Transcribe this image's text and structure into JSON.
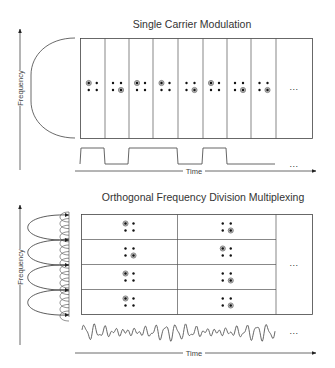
{
  "top_panel": {
    "title": "Single Carrier Modulation",
    "y_axis_label": "Frequency",
    "x_axis_label": "Time",
    "ellipsis_grid": "...",
    "ellipsis_signal": "...",
    "columns": [
      {
        "marked": "top-left"
      },
      {
        "marked": "bottom-right"
      },
      {
        "marked": "top-left"
      },
      {
        "marked": "top-left"
      },
      {
        "marked": "bottom-right"
      },
      {
        "marked": "top-left"
      },
      {
        "marked": "bottom-right"
      },
      {
        "marked": "bottom-right"
      }
    ],
    "signal_bits": [
      1,
      0,
      1,
      1,
      0,
      1,
      0,
      0
    ]
  },
  "bottom_panel": {
    "title": "Orthogonal Frequency Division Multiplexing",
    "y_axis_label": "Frequency",
    "x_axis_label": "Time",
    "ellipsis_grid": "...",
    "ellipsis_signal": "...",
    "grid": [
      [
        {
          "marked": "top-left"
        },
        {
          "marked": "bottom-right"
        }
      ],
      [
        {
          "marked": "bottom-right"
        },
        {
          "marked": "top-left"
        }
      ],
      [
        {
          "marked": "top-left"
        },
        {
          "marked": "bottom-right"
        }
      ],
      [
        {
          "marked": "top-left"
        },
        {
          "marked": "bottom-right"
        }
      ]
    ]
  },
  "colors": {
    "line": "#333333",
    "dot": "#111111",
    "marked_ring": "#777777"
  }
}
